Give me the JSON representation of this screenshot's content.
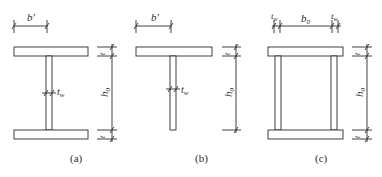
{
  "figures": [
    {
      "id": "a",
      "caption": "(a)",
      "type": "I-section",
      "labels": {
        "flange_width": "b'",
        "web_thickness": "t",
        "web_thickness_sub": "w",
        "height": "h",
        "height_sub": "0",
        "flange_thickness_top": "t",
        "flange_thickness_bottom": "t"
      }
    },
    {
      "id": "b",
      "caption": "(b)",
      "type": "T-section",
      "labels": {
        "flange_width": "b'",
        "web_thickness": "t",
        "web_thickness_sub": "w",
        "height": "h",
        "height_sub": "0",
        "flange_thickness_top": "t"
      }
    },
    {
      "id": "c",
      "caption": "(c)",
      "type": "Box-section",
      "labels": {
        "web_thickness_left": "t",
        "web_thickness_left_sub": "w",
        "inner_width": "b",
        "inner_width_sub": "0",
        "web_thickness_right": "t",
        "web_thickness_right_sub": "w",
        "height": "h",
        "height_sub": "0",
        "flange_thickness_top": "t",
        "flange_thickness_bottom": "t"
      }
    }
  ],
  "colors": {
    "line": "#2b2b2b",
    "background": "#ffffff"
  }
}
